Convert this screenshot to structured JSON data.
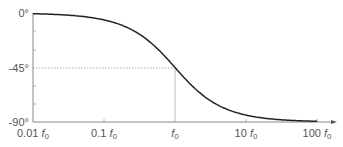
{
  "chart_data": {
    "type": "line",
    "title": "",
    "xlabel": "",
    "ylabel": "",
    "x_scale": "log",
    "x_tick_labels": [
      "0.01 f0",
      "0.1 f0",
      "f0",
      "10 f0",
      "100 f0"
    ],
    "x_tick_values": [
      0.01,
      0.1,
      1,
      10,
      100
    ],
    "y_tick_labels": [
      "0°",
      "-45°",
      "-90°"
    ],
    "y_tick_values": [
      0,
      -45,
      -90
    ],
    "ylim": [
      -90,
      0
    ],
    "xlim": [
      0.01,
      100
    ],
    "grid": false,
    "annotations": [
      "dotted guide at -45°",
      "vertical guide at f0"
    ],
    "series": [
      {
        "name": "phase",
        "x": [
          0.01,
          0.03,
          0.1,
          0.3,
          1,
          3,
          10,
          30,
          100
        ],
        "values": [
          -0.6,
          -1.7,
          -5.7,
          -16.7,
          -45,
          -71.6,
          -84.3,
          -88.1,
          -89.4
        ]
      }
    ]
  },
  "labels": {
    "y0": "0°",
    "y45": "-45°",
    "y90": "-90°",
    "x0": "0.01",
    "x1": "0.1",
    "x2": "",
    "x3": "10",
    "x4": "100",
    "f": "f",
    "sub": "0"
  }
}
